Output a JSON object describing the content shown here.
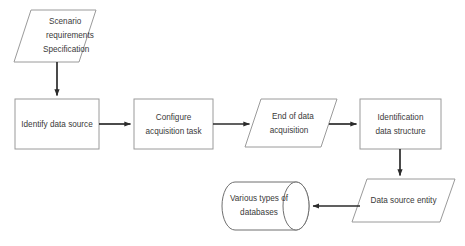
{
  "diagram": {
    "background_color": "#ffffff",
    "shape_stroke_color": "#9a9a9a",
    "arrow_color": "#2b2b2b",
    "text_color": "#3a3a3a",
    "nodes": [
      {
        "id": "scenario-requirements-specification",
        "shape": "parallelogram",
        "lines": [
          "Scenario",
          "requirements",
          "Specification"
        ],
        "align": "left"
      },
      {
        "id": "identify-data-source",
        "shape": "rectangle",
        "lines": [
          "Identify data source"
        ],
        "align": "center"
      },
      {
        "id": "configure-acquisition-task",
        "shape": "rectangle",
        "lines": [
          "Configure",
          "acquisition task"
        ],
        "align": "center"
      },
      {
        "id": "end-of-data-acquisition",
        "shape": "parallelogram",
        "lines": [
          "End of data",
          "acquisition"
        ],
        "align": "center"
      },
      {
        "id": "identification-data-structure",
        "shape": "rectangle",
        "lines": [
          "Identification",
          "data structure"
        ],
        "align": "center"
      },
      {
        "id": "data-source-entity",
        "shape": "parallelogram",
        "lines": [
          "Data source entity"
        ],
        "align": "center"
      },
      {
        "id": "various-types-of-databases",
        "shape": "cylinder",
        "lines": [
          "Various types of",
          "databases"
        ],
        "align": "center"
      }
    ],
    "edges": [
      {
        "id": "edge-scenario-to-identify",
        "from": "scenario-requirements-specification",
        "to": "identify-data-source",
        "direction": "down"
      },
      {
        "id": "edge-identify-to-configure",
        "from": "identify-data-source",
        "to": "configure-acquisition-task",
        "direction": "right"
      },
      {
        "id": "edge-configure-to-end",
        "from": "configure-acquisition-task",
        "to": "end-of-data-acquisition",
        "direction": "right"
      },
      {
        "id": "edge-end-to-identification",
        "from": "end-of-data-acquisition",
        "to": "identification-data-structure",
        "direction": "right"
      },
      {
        "id": "edge-identification-to-entity",
        "from": "identification-data-structure",
        "to": "data-source-entity",
        "direction": "down"
      },
      {
        "id": "edge-entity-to-databases",
        "from": "data-source-entity",
        "to": "various-types-of-databases",
        "direction": "left"
      }
    ]
  }
}
